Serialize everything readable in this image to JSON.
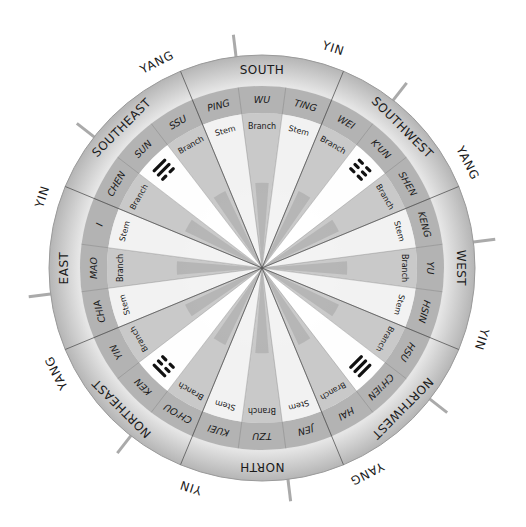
{
  "diagram": {
    "geometry": {
      "cx": 262,
      "cy": 268,
      "r_outer": 213,
      "r_middle": 182,
      "r_inner": 155
    },
    "colors": {
      "outer_ring": "#c9c9c9",
      "middle_ring": "#b3b3b3",
      "inner_light": "#f4f4f4",
      "inner_dark": "#a9a9a9",
      "divider": "#555555",
      "tick": "#aaaaaa",
      "text": "#1a1a1a",
      "trigram": "#111111"
    },
    "directions": [
      {
        "label": "SOUTH",
        "angle": -90
      },
      {
        "label": "SOUTHWEST",
        "angle": -45
      },
      {
        "label": "WEST",
        "angle": 0
      },
      {
        "label": "NORTHWEST",
        "angle": 45
      },
      {
        "label": "NORTH",
        "angle": 90
      },
      {
        "label": "NORTHEAST",
        "angle": 135
      },
      {
        "label": "EAST",
        "angle": 180
      },
      {
        "label": "SOUTHEAST",
        "angle": -135
      }
    ],
    "polarity": [
      {
        "label": "YIN",
        "angle": -72
      },
      {
        "label": "YANG",
        "angle": -27
      },
      {
        "label": "YIN",
        "angle": 18
      },
      {
        "label": "YANG",
        "angle": 63
      },
      {
        "label": "YIN",
        "angle": 108
      },
      {
        "label": "YANG",
        "angle": 153
      },
      {
        "label": "YIN",
        "angle": -162
      },
      {
        "label": "YANG",
        "angle": -117
      }
    ],
    "ticks": [
      -97,
      -52,
      -7,
      38,
      83,
      128,
      173,
      -142
    ],
    "mountains": [
      {
        "name": "SSU",
        "kind": "Branch",
        "angle": -120
      },
      {
        "name": "PING",
        "kind": "Stem",
        "angle": -105
      },
      {
        "name": "WU",
        "kind": "Branch",
        "angle": -90
      },
      {
        "name": "TING",
        "kind": "Stem",
        "angle": -75
      },
      {
        "name": "WEI",
        "kind": "Branch",
        "angle": -60
      },
      {
        "name": "K'UN",
        "kind": "Trigram",
        "angle": -45
      },
      {
        "name": "SHEN",
        "kind": "Branch",
        "angle": -30
      },
      {
        "name": "KENG",
        "kind": "Stem",
        "angle": -15
      },
      {
        "name": "YU",
        "kind": "Branch",
        "angle": 0
      },
      {
        "name": "HSIN",
        "kind": "Stem",
        "angle": 15
      },
      {
        "name": "HSU",
        "kind": "Branch",
        "angle": 30
      },
      {
        "name": "CH'IEN",
        "kind": "Trigram",
        "angle": 45
      },
      {
        "name": "HAI",
        "kind": "Branch",
        "angle": 60
      },
      {
        "name": "JEN",
        "kind": "Stem",
        "angle": 75
      },
      {
        "name": "TZU",
        "kind": "Branch",
        "angle": 90
      },
      {
        "name": "KUEI",
        "kind": "Stem",
        "angle": 105
      },
      {
        "name": "CH'OU",
        "kind": "Branch",
        "angle": 120
      },
      {
        "name": "KEN",
        "kind": "Trigram",
        "angle": 135
      },
      {
        "name": "YIN",
        "kind": "Branch",
        "angle": 150
      },
      {
        "name": "CHIA",
        "kind": "Stem",
        "angle": 165
      },
      {
        "name": "MAO",
        "kind": "Branch",
        "angle": 180
      },
      {
        "name": "I",
        "kind": "Stem",
        "angle": -165
      },
      {
        "name": "CHEN",
        "kind": "Branch",
        "angle": -150
      },
      {
        "name": "SUN",
        "kind": "Trigram",
        "angle": -135
      }
    ],
    "trigrams": [
      {
        "name": "K'UN",
        "angle": -45,
        "lines": [
          "broken",
          "broken",
          "broken"
        ]
      },
      {
        "name": "CH'IEN",
        "angle": 45,
        "lines": [
          "solid",
          "solid",
          "solid"
        ]
      },
      {
        "name": "KEN",
        "angle": 135,
        "lines": [
          "solid",
          "broken",
          "broken"
        ]
      },
      {
        "name": "SUN",
        "angle": -135,
        "lines": [
          "solid",
          "solid",
          "broken"
        ]
      }
    ],
    "kind_labels": {
      "stem": "Stem",
      "branch": "Branch"
    }
  }
}
